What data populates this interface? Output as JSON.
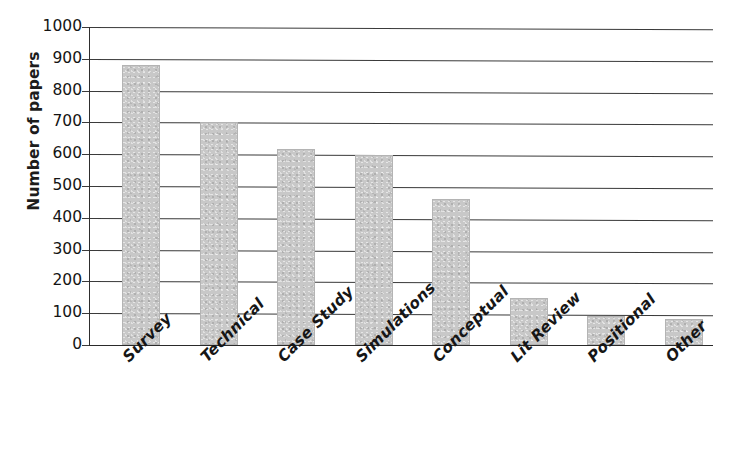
{
  "chart_data": {
    "type": "bar",
    "title": "",
    "xlabel": "",
    "ylabel": "Number of papers",
    "categories": [
      "Survey",
      "Technical",
      "Case Study",
      "Simulations",
      "Conceptual",
      "Lit Review",
      "Positional",
      "Other"
    ],
    "values": [
      880,
      700,
      615,
      598,
      460,
      148,
      92,
      82
    ],
    "ylim": [
      0,
      1000
    ],
    "y_ticks": [
      0,
      100,
      200,
      300,
      400,
      500,
      600,
      700,
      800,
      900,
      1000
    ],
    "y_tick_labels": [
      "0",
      "100",
      "200",
      "300",
      "400",
      "500",
      "600",
      "700",
      "800",
      "900",
      "1000"
    ],
    "grid": true,
    "legend": false,
    "bar_color": "#c8c8c8",
    "axis_color": "#2e2e2e",
    "gridline_color": "#3a3a3a",
    "x_label_rotation": -45
  }
}
